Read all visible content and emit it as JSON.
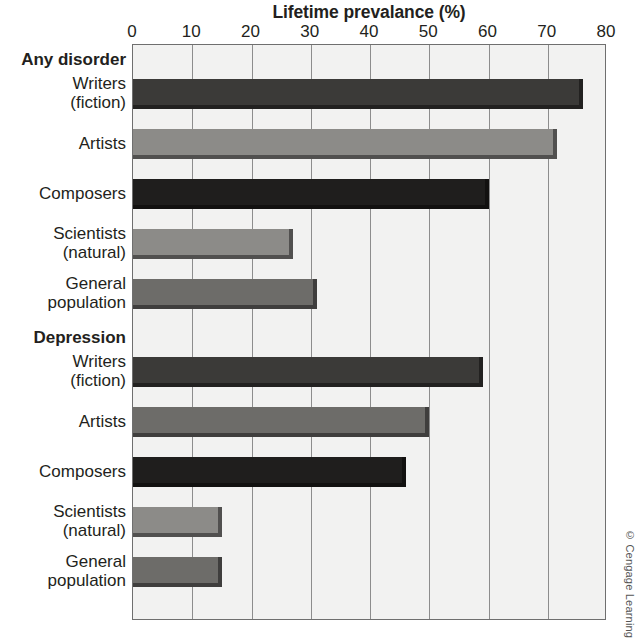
{
  "chart_data": {
    "type": "bar",
    "orientation": "horizontal",
    "title": "Lifetime prevalance (%)",
    "xlabel": "Lifetime prevalance (%)",
    "ylabel": "",
    "xlim": [
      0,
      80
    ],
    "xticks": [
      0,
      10,
      20,
      30,
      40,
      50,
      60,
      70,
      80
    ],
    "xtick_labels": [
      "0",
      "10",
      "20",
      "30",
      "40",
      "50",
      "60",
      "70",
      "80"
    ],
    "grid": true,
    "grid_axis": "x",
    "legend": "none",
    "groups": [
      {
        "name": "Any disorder",
        "categories": [
          "Writers (fiction)",
          "Artists",
          "Composers",
          "Scientists (natural)",
          "General population"
        ],
        "values": [
          76,
          71.5,
          60,
          27,
          31
        ]
      },
      {
        "name": "Depression",
        "categories": [
          "Writers (fiction)",
          "Artists",
          "Composers",
          "Scientists (natural)",
          "General population"
        ],
        "values": [
          59,
          50,
          46,
          15,
          15
        ]
      }
    ],
    "categories": [
      "Writers (fiction)",
      "Artists",
      "Composers",
      "Scientists (natural)",
      "General population",
      "Writers (fiction)",
      "Artists",
      "Composers",
      "Scientists (natural)",
      "General population"
    ],
    "values": [
      76,
      71.5,
      60,
      27,
      31,
      59,
      50,
      46,
      15,
      15
    ],
    "bar_colors": [
      "#3b3a38",
      "#8c8b88",
      "#1f1e1d",
      "#8c8b88",
      "#6d6c69",
      "#3b3a38",
      "#6d6c69",
      "#1f1e1d",
      "#8c8b88",
      "#6d6c69"
    ],
    "annotations": [
      "© Cengage Learning"
    ]
  },
  "axis": {
    "title": "Lifetime prevalance (%)",
    "ticks": [
      {
        "value": 0,
        "label": "0"
      },
      {
        "value": 10,
        "label": "10"
      },
      {
        "value": 20,
        "label": "20"
      },
      {
        "value": 30,
        "label": "30"
      },
      {
        "value": 40,
        "label": "40"
      },
      {
        "value": 50,
        "label": "50"
      },
      {
        "value": 60,
        "label": "60"
      },
      {
        "value": 70,
        "label": "70"
      },
      {
        "value": 80,
        "label": "80"
      }
    ]
  },
  "rows": [
    {
      "kind": "group",
      "lines": [
        "Any disorder"
      ],
      "value": null
    },
    {
      "kind": "bar",
      "lines": [
        "Writers",
        "(fiction)"
      ],
      "value": 76,
      "color": "#3b3a38"
    },
    {
      "kind": "bar",
      "lines": [
        "Artists"
      ],
      "value": 71.5,
      "color": "#8c8b88"
    },
    {
      "kind": "bar",
      "lines": [
        "Composers"
      ],
      "value": 60,
      "color": "#1f1e1d"
    },
    {
      "kind": "bar",
      "lines": [
        "Scientists",
        "(natural)"
      ],
      "value": 27,
      "color": "#8c8b88"
    },
    {
      "kind": "bar",
      "lines": [
        "General",
        "population"
      ],
      "value": 31,
      "color": "#6d6c69"
    },
    {
      "kind": "group",
      "lines": [
        "Depression"
      ],
      "value": null
    },
    {
      "kind": "bar",
      "lines": [
        "Writers",
        "(fiction)"
      ],
      "value": 59,
      "color": "#3b3a38"
    },
    {
      "kind": "bar",
      "lines": [
        "Artists"
      ],
      "value": 50,
      "color": "#6d6c69"
    },
    {
      "kind": "bar",
      "lines": [
        "Composers"
      ],
      "value": 46,
      "color": "#1f1e1d"
    },
    {
      "kind": "bar",
      "lines": [
        "Scientists",
        "(natural)"
      ],
      "value": 15,
      "color": "#8c8b88"
    },
    {
      "kind": "bar",
      "lines": [
        "General",
        "population"
      ],
      "value": 15,
      "color": "#6d6c69"
    }
  ],
  "credit": "© Cengage Learning",
  "colors": {
    "plot_background": "#f2f2f1",
    "frame": "#6f6f6f",
    "gridline": "#8d8d8d",
    "text": "#231f20"
  }
}
